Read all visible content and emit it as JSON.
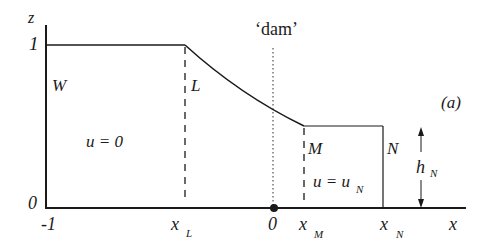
{
  "diagram": {
    "panel_label": "(a)",
    "axes": {
      "z_axis_label": "z",
      "x_axis_label": "x",
      "z_ticks": [
        "1",
        "0"
      ],
      "x_ticks": [
        "-1",
        "x",
        "0",
        "x",
        "x"
      ],
      "x_tick_subscripts": [
        "",
        "L",
        "",
        "M",
        "N"
      ]
    },
    "dam_label": "‘dam’",
    "points": {
      "W": "W",
      "L": "L",
      "M": "M",
      "N": "N"
    },
    "regions": {
      "left_velocity": "u = 0",
      "right_velocity_main": "u = u",
      "right_velocity_sub": "N"
    },
    "height_marker": {
      "label_main": "h",
      "label_sub": "N"
    },
    "colors": {
      "line": "#1a1a1a",
      "background": "#ffffff"
    }
  }
}
